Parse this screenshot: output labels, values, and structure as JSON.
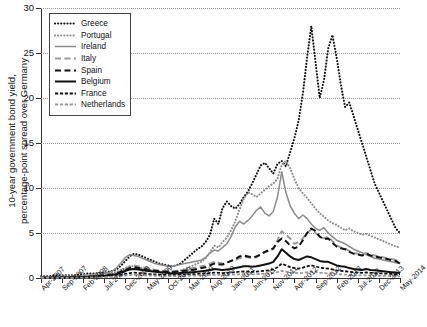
{
  "chart_data": {
    "type": "line",
    "title": "",
    "xlabel": "",
    "ylabel": "10-year government bond yield,\npercentage-point spread over Germany",
    "ylim": [
      0,
      30
    ],
    "yticks": [
      0,
      5,
      10,
      15,
      20,
      25,
      30
    ],
    "grid": true,
    "legend_position": "top-left",
    "x_tick_labels": [
      "Apr-2007",
      "Sep-2007",
      "Feb-2008",
      "Jul-2008",
      "Dec-2008",
      "May-2009",
      "Oct-2009",
      "Mar-2010",
      "Aug-2010",
      "Jan-2011",
      "Jun-2011",
      "Nov-2011",
      "Apr-2012",
      "Sep-2012",
      "Feb-2013",
      "Jul-2013",
      "Dec-2013",
      "May-2014"
    ],
    "x_start": "Apr-2007",
    "x_end": "May-2014",
    "x_point_interval_months": 1,
    "n_points": 86,
    "series": [
      {
        "name": "Greece",
        "color": "#111111",
        "style": "dotted",
        "values": [
          0.2,
          0.2,
          0.2,
          0.3,
          0.3,
          0.3,
          0.3,
          0.3,
          0.3,
          0.4,
          0.4,
          0.5,
          0.5,
          0.5,
          0.6,
          0.6,
          0.7,
          0.8,
          1.0,
          1.4,
          1.9,
          2.4,
          2.7,
          2.6,
          2.4,
          2.2,
          2.0,
          1.8,
          1.6,
          1.5,
          1.4,
          1.3,
          1.4,
          1.6,
          2.0,
          2.4,
          2.8,
          3.2,
          3.5,
          4.0,
          4.8,
          6.6,
          6.0,
          7.8,
          8.5,
          8.0,
          7.7,
          8.2,
          9.0,
          9.6,
          10.5,
          11.5,
          12.5,
          12.8,
          12.2,
          11.6,
          12.7,
          13.0,
          12.4,
          14.0,
          15.5,
          17.5,
          20.5,
          24.5,
          28.0,
          24.0,
          20.0,
          22.0,
          25.5,
          27.0,
          24.5,
          21.5,
          19.0,
          19.5,
          18.0,
          16.5,
          15.0,
          13.5,
          12.0,
          10.5,
          9.5,
          8.5,
          7.5,
          6.5,
          5.5,
          5.0
        ]
      },
      {
        "name": "Portugal",
        "color": "#8c8c8c",
        "style": "dotted",
        "values": [
          0.1,
          0.1,
          0.1,
          0.1,
          0.1,
          0.2,
          0.2,
          0.2,
          0.2,
          0.2,
          0.3,
          0.3,
          0.3,
          0.4,
          0.4,
          0.5,
          0.5,
          0.6,
          0.7,
          0.9,
          1.1,
          1.3,
          1.3,
          1.2,
          1.1,
          1.0,
          0.9,
          0.8,
          0.7,
          0.7,
          0.6,
          0.6,
          0.7,
          0.8,
          1.0,
          1.2,
          1.4,
          1.6,
          1.8,
          2.2,
          2.8,
          3.6,
          3.4,
          4.0,
          4.5,
          5.3,
          6.3,
          7.6,
          8.8,
          9.5,
          9.3,
          9.0,
          9.4,
          9.8,
          10.2,
          10.5,
          11.0,
          12.6,
          13.0,
          12.2,
          11.0,
          10.0,
          9.4,
          8.9,
          8.3,
          7.7,
          7.2,
          6.8,
          6.4,
          6.1,
          5.9,
          5.6,
          5.3,
          5.5,
          5.2,
          5.0,
          4.8,
          4.9,
          4.7,
          4.5,
          4.3,
          4.1,
          3.9,
          3.7,
          3.5,
          3.4
        ]
      },
      {
        "name": "Ireland",
        "color": "#8c8c8c",
        "style": "solid",
        "values": [
          0.05,
          0.05,
          0.05,
          0.05,
          0.05,
          0.1,
          0.1,
          0.1,
          0.15,
          0.2,
          0.25,
          0.3,
          0.3,
          0.3,
          0.4,
          0.5,
          0.6,
          0.8,
          1.2,
          1.7,
          2.3,
          2.6,
          2.5,
          2.4,
          2.2,
          2.0,
          1.8,
          1.6,
          1.5,
          1.4,
          1.3,
          1.3,
          1.4,
          1.5,
          1.6,
          1.7,
          1.8,
          1.9,
          2.0,
          2.3,
          2.8,
          3.1,
          3.0,
          3.4,
          3.8,
          4.6,
          5.7,
          6.3,
          6.0,
          6.4,
          6.9,
          7.5,
          7.9,
          7.2,
          6.9,
          7.4,
          9.0,
          11.8,
          9.5,
          8.0,
          7.2,
          6.6,
          7.0,
          6.6,
          6.0,
          5.5,
          5.3,
          5.6,
          5.0,
          4.6,
          4.2,
          4.0,
          3.8,
          3.5,
          3.2,
          3.0,
          2.8,
          2.6,
          2.4,
          2.2,
          2.1,
          2.0,
          1.9,
          1.8,
          1.7,
          1.6
        ]
      },
      {
        "name": "Italy",
        "color": "#9a9a9a",
        "style": "dashed",
        "values": [
          0.05,
          0.05,
          0.05,
          0.05,
          0.1,
          0.1,
          0.1,
          0.1,
          0.15,
          0.2,
          0.2,
          0.25,
          0.3,
          0.3,
          0.35,
          0.4,
          0.45,
          0.5,
          0.6,
          0.8,
          1.0,
          1.3,
          1.4,
          1.3,
          1.2,
          1.1,
          1.0,
          0.9,
          0.85,
          0.8,
          0.8,
          0.75,
          0.8,
          0.85,
          0.9,
          1.0,
          1.1,
          1.2,
          1.3,
          1.4,
          1.6,
          1.8,
          1.7,
          1.6,
          1.7,
          1.9,
          2.0,
          2.2,
          2.3,
          2.3,
          2.2,
          2.3,
          2.6,
          2.9,
          3.0,
          3.2,
          4.2,
          5.2,
          4.8,
          4.4,
          3.8,
          4.0,
          4.4,
          5.0,
          5.4,
          5.0,
          4.6,
          4.4,
          4.6,
          4.1,
          3.6,
          3.4,
          3.3,
          3.0,
          2.8,
          2.7,
          2.6,
          2.8,
          2.6,
          2.5,
          2.4,
          2.3,
          2.2,
          2.1,
          2.0,
          1.6
        ]
      },
      {
        "name": "Spain",
        "color": "#111111",
        "style": "dashed",
        "values": [
          0.03,
          0.03,
          0.03,
          0.04,
          0.05,
          0.05,
          0.06,
          0.07,
          0.08,
          0.1,
          0.12,
          0.15,
          0.18,
          0.2,
          0.25,
          0.3,
          0.35,
          0.4,
          0.5,
          0.7,
          0.9,
          1.1,
          1.2,
          1.1,
          1.0,
          0.9,
          0.85,
          0.8,
          0.75,
          0.7,
          0.7,
          0.65,
          0.7,
          0.75,
          0.8,
          0.85,
          0.9,
          1.0,
          1.1,
          1.2,
          1.4,
          1.6,
          1.5,
          1.5,
          1.7,
          1.9,
          2.1,
          2.4,
          2.5,
          2.4,
          2.3,
          2.4,
          2.6,
          2.9,
          3.1,
          3.3,
          4.0,
          4.4,
          4.1,
          3.6,
          3.3,
          3.5,
          4.2,
          5.0,
          5.5,
          5.2,
          4.6,
          4.3,
          4.4,
          3.9,
          3.5,
          3.3,
          3.2,
          2.9,
          2.7,
          2.6,
          2.5,
          2.7,
          2.5,
          2.4,
          2.3,
          2.2,
          2.1,
          2.0,
          1.9,
          1.6
        ]
      },
      {
        "name": "Belgium",
        "color": "#111111",
        "style": "solid-thick",
        "values": [
          0.02,
          0.02,
          0.02,
          0.03,
          0.03,
          0.04,
          0.05,
          0.05,
          0.06,
          0.08,
          0.1,
          0.12,
          0.15,
          0.18,
          0.2,
          0.25,
          0.3,
          0.35,
          0.45,
          0.6,
          0.8,
          0.95,
          1.0,
          0.95,
          0.9,
          0.8,
          0.75,
          0.7,
          0.65,
          0.6,
          0.55,
          0.5,
          0.5,
          0.55,
          0.6,
          0.6,
          0.65,
          0.7,
          0.75,
          0.8,
          0.9,
          1.0,
          0.95,
          0.9,
          0.95,
          1.0,
          1.1,
          1.2,
          1.3,
          1.3,
          1.25,
          1.3,
          1.4,
          1.5,
          1.6,
          1.8,
          2.4,
          3.2,
          2.8,
          2.4,
          2.1,
          2.0,
          2.2,
          2.4,
          2.3,
          2.1,
          1.9,
          1.8,
          1.8,
          1.6,
          1.4,
          1.3,
          1.25,
          1.1,
          1.0,
          0.95,
          0.9,
          1.0,
          0.9,
          0.85,
          0.8,
          0.75,
          0.7,
          0.65,
          0.6,
          0.55
        ]
      },
      {
        "name": "France",
        "color": "#111111",
        "style": "dash-dot-fine",
        "values": [
          0.02,
          0.02,
          0.02,
          0.02,
          0.03,
          0.03,
          0.03,
          0.04,
          0.04,
          0.05,
          0.06,
          0.07,
          0.08,
          0.1,
          0.12,
          0.15,
          0.18,
          0.2,
          0.25,
          0.35,
          0.45,
          0.55,
          0.6,
          0.55,
          0.5,
          0.45,
          0.42,
          0.4,
          0.38,
          0.35,
          0.33,
          0.3,
          0.32,
          0.35,
          0.38,
          0.4,
          0.42,
          0.45,
          0.48,
          0.5,
          0.55,
          0.6,
          0.58,
          0.55,
          0.58,
          0.6,
          0.65,
          0.7,
          0.72,
          0.7,
          0.68,
          0.7,
          0.75,
          0.8,
          0.85,
          0.95,
          1.2,
          1.6,
          1.4,
          1.2,
          1.1,
          1.05,
          1.15,
          1.3,
          1.4,
          1.3,
          1.15,
          1.1,
          1.05,
          0.95,
          0.85,
          0.8,
          0.75,
          0.7,
          0.65,
          0.6,
          0.58,
          0.62,
          0.58,
          0.55,
          0.52,
          0.5,
          0.48,
          0.45,
          0.42,
          0.4
        ]
      },
      {
        "name": "Netherlands",
        "color": "#9a9a9a",
        "style": "dash-dot-fine",
        "values": [
          0.01,
          0.01,
          0.01,
          0.01,
          0.02,
          0.02,
          0.02,
          0.02,
          0.03,
          0.03,
          0.04,
          0.05,
          0.06,
          0.07,
          0.08,
          0.1,
          0.12,
          0.14,
          0.18,
          0.22,
          0.28,
          0.32,
          0.35,
          0.32,
          0.3,
          0.28,
          0.26,
          0.25,
          0.24,
          0.22,
          0.2,
          0.2,
          0.2,
          0.22,
          0.24,
          0.25,
          0.26,
          0.28,
          0.3,
          0.32,
          0.34,
          0.36,
          0.35,
          0.34,
          0.35,
          0.36,
          0.38,
          0.4,
          0.42,
          0.4,
          0.4,
          0.42,
          0.45,
          0.48,
          0.5,
          0.55,
          0.65,
          0.8,
          0.72,
          0.62,
          0.56,
          0.54,
          0.58,
          0.65,
          0.7,
          0.65,
          0.58,
          0.55,
          0.52,
          0.48,
          0.44,
          0.4,
          0.38,
          0.35,
          0.32,
          0.3,
          0.28,
          0.3,
          0.28,
          0.26,
          0.25,
          0.24,
          0.22,
          0.2,
          0.2,
          0.18
        ]
      }
    ]
  }
}
